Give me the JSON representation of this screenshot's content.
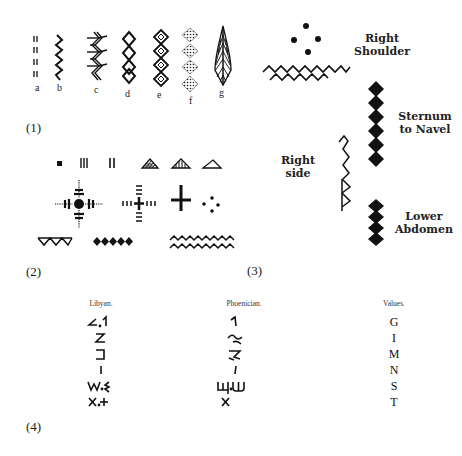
{
  "figure": {
    "panel1": {
      "number": "(1)",
      "patterns": [
        {
          "id": "a",
          "label": "a",
          "motif": "paired-dashes-icon"
        },
        {
          "id": "b",
          "label": "b",
          "motif": "zigzag-line-icon"
        },
        {
          "id": "c",
          "label": "c",
          "motif": "feathered-zigzag-icon"
        },
        {
          "id": "d",
          "label": "d",
          "motif": "chain-of-diamonds-icon"
        },
        {
          "id": "e",
          "label": "e",
          "motif": "nested-diamonds-icon"
        },
        {
          "id": "f",
          "label": "f",
          "motif": "dotted-diamonds-icon"
        },
        {
          "id": "g",
          "label": "g",
          "motif": "leaf-hatched-icon"
        }
      ]
    },
    "panel2": {
      "number": "(2)",
      "motifs": [
        "square-dot",
        "triple-bar",
        "double-bar",
        "hatched-triangle",
        "striped-triangle",
        "open-triangle",
        "dashed-cross-with-dot",
        "dashed-cross",
        "solid-cross",
        "four-dots",
        "triangle-row",
        "diamond-row",
        "double-zigzag"
      ]
    },
    "panel3": {
      "number": "(3)",
      "labels": {
        "right_shoulder_1": "Right",
        "right_shoulder_2": "Shoulder",
        "sternum_1": "Sternum",
        "sternum_2": "to Navel",
        "right_side": "Right side",
        "lower_1": "Lower",
        "lower_2": "Abdomen"
      }
    },
    "panel4": {
      "number": "(4)",
      "columns": {
        "libyan": "Libyan.",
        "phoenician": "Phoenician.",
        "values": "Values."
      },
      "rows": [
        {
          "libyan": "∠,⦁1",
          "phoenician": "1",
          "value": "G"
        },
        {
          "libyan": "Z",
          "phoenician": "⌁",
          "value": "I"
        },
        {
          "libyan": "⊐",
          "phoenician": "ᡃ",
          "value": "M"
        },
        {
          "libyan": "I",
          "phoenician": "ı",
          "value": "N"
        },
        {
          "libyan": "W,Ɛ",
          "phoenician": "Ш,Ш",
          "value": "S"
        },
        {
          "libyan": "X,+",
          "phoenician": "X",
          "value": "T"
        }
      ]
    }
  }
}
